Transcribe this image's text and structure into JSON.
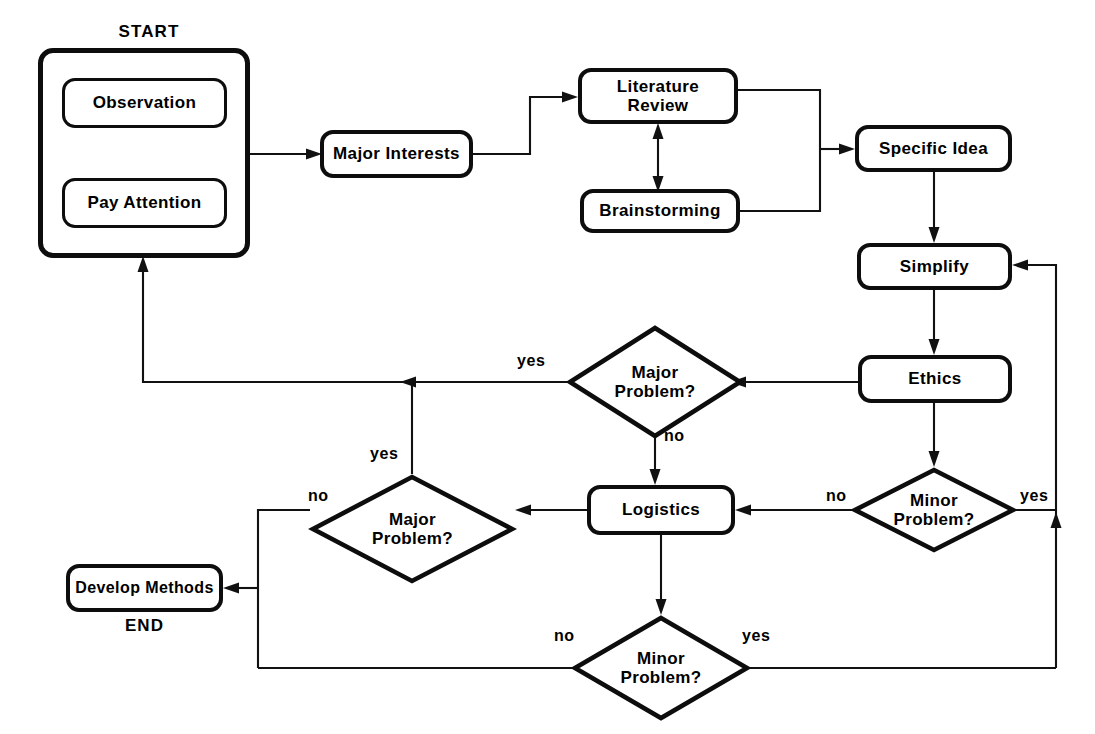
{
  "diagram": {
    "start_caption": "START",
    "end_caption": "END",
    "line_color": "#111111",
    "node_border_color": "#0d0d0d",
    "background_color": "#ffffff"
  },
  "nodes": {
    "observation": "Observation",
    "pay_attention": "Pay Attention",
    "major_interests": "Major Interests",
    "literature_review": "Literature\nReview",
    "literature_review_l1": "Literature",
    "literature_review_l2": "Review",
    "brainstorming": "Brainstorming",
    "specific_idea": "Specific Idea",
    "simplify": "Simplify",
    "ethics": "Ethics",
    "logistics": "Logistics",
    "develop_methods": "Develop Methods"
  },
  "decisions": {
    "major_problem_1_l1": "Major",
    "major_problem_1_l2": "Problem?",
    "minor_problem_1_l1": "Minor",
    "minor_problem_1_l2": "Problem?",
    "major_problem_2_l1": "Major",
    "major_problem_2_l2": "Problem?",
    "minor_problem_2_l1": "Minor",
    "minor_problem_2_l2": "Problem?"
  },
  "edge_labels": {
    "mp1_yes": "yes",
    "mp1_no": "no",
    "mn1_no": "no",
    "mn1_yes": "yes",
    "mp2_yes": "yes",
    "mp2_no": "no",
    "mn2_no": "no",
    "mn2_yes": "yes"
  }
}
